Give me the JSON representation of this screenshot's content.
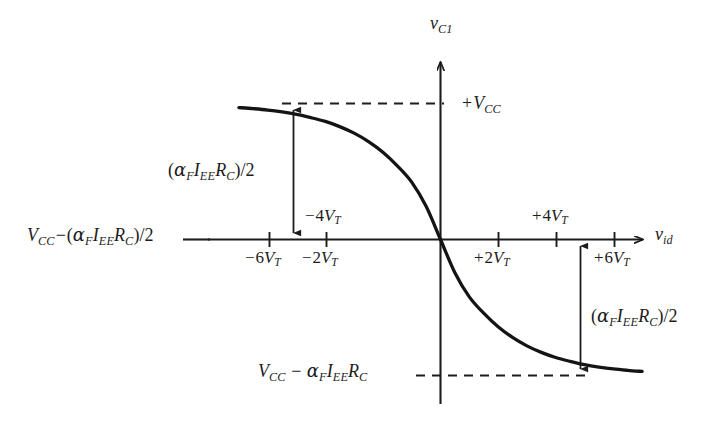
{
  "figure": {
    "background_color": "#ffffff",
    "ink_color": "#1c1c1c"
  },
  "axes": {
    "y_axis_label": "v_C1",
    "x_axis_label": "v_id",
    "y_axis_label_parts": {
      "var": "v",
      "sub": "C1"
    },
    "x_axis_label_parts": {
      "var": "v",
      "sub": "id"
    }
  },
  "level_labels": {
    "top_level": "+V_CC",
    "top_level_parts": {
      "sign": "+",
      "var": "V",
      "sub": "CC"
    },
    "mid_level": "V_CC−(α_F I_EE R_C)/2",
    "bottom_level": "V_CC − α_F I_EE R_C"
  },
  "span_labels": {
    "upper": "(α_F I_EE R_C)/2",
    "lower": "(α_F I_EE R_C)/2"
  },
  "tick_labels": {
    "m6": "−6V_T",
    "m4": "−4V_T",
    "m2": "−2V_T",
    "p2": "+2V_T",
    "p4": "+4V_T",
    "p6": "+6V_T"
  },
  "chart_data": {
    "type": "line",
    "title": "",
    "xlabel": "v_id",
    "ylabel": "v_C1",
    "grid": false,
    "legend": null,
    "x_unit": "V_T",
    "xlim": [
      -7.2,
      7.2
    ],
    "ylim_labels": [
      "V_CC − α_F I_EE R_C",
      "+V_CC"
    ],
    "x_tick_values": [
      -6,
      -4,
      -2,
      0,
      2,
      4,
      6
    ],
    "x_tick_labels": [
      "−6V_T",
      "−4V_T",
      "−2V_T",
      "",
      "+2V_T",
      "+4V_T",
      "+6V_T"
    ],
    "y_reference_levels": [
      {
        "label": "+V_CC",
        "normalized": 1.0,
        "dashed": true
      },
      {
        "label": "V_CC−(α_F I_EE R_C)/2",
        "normalized": 0.5,
        "dashed": false
      },
      {
        "label": "V_CC − α_F I_EE R_C",
        "normalized": 0.0,
        "dashed": true
      }
    ],
    "equation": "v_C1 = V_CC − (α_F I_EE R_C)/2 · [1 + tanh(v_id / (2 V_T))]",
    "series": [
      {
        "name": "v_C1",
        "x": [
          -7.0,
          -6.5,
          -6.0,
          -5.5,
          -5.0,
          -4.5,
          -4.0,
          -3.5,
          -3.0,
          -2.5,
          -2.0,
          -1.5,
          -1.0,
          -0.5,
          0.0,
          0.5,
          1.0,
          1.5,
          2.0,
          2.5,
          3.0,
          3.5,
          4.0,
          4.5,
          5.0,
          5.5,
          6.0,
          6.5,
          7.0
        ],
        "y_normalized": [
          0.985,
          0.981,
          0.976,
          0.969,
          0.96,
          0.948,
          0.934,
          0.915,
          0.891,
          0.86,
          0.821,
          0.771,
          0.711,
          0.622,
          0.5,
          0.378,
          0.289,
          0.229,
          0.179,
          0.14,
          0.109,
          0.085,
          0.066,
          0.052,
          0.04,
          0.031,
          0.024,
          0.019,
          0.015
        ]
      }
    ],
    "annotations": [
      {
        "text": "(α_F I_EE R_C)/2",
        "kind": "double-arrow-vertical",
        "at_x": -4,
        "from_normalized": 0.5,
        "to_normalized": 1.0
      },
      {
        "text": "(α_F I_EE R_C)/2",
        "kind": "double-arrow-vertical",
        "at_x": 4.8,
        "from_normalized": 0.0,
        "to_normalized": 0.5
      }
    ]
  }
}
